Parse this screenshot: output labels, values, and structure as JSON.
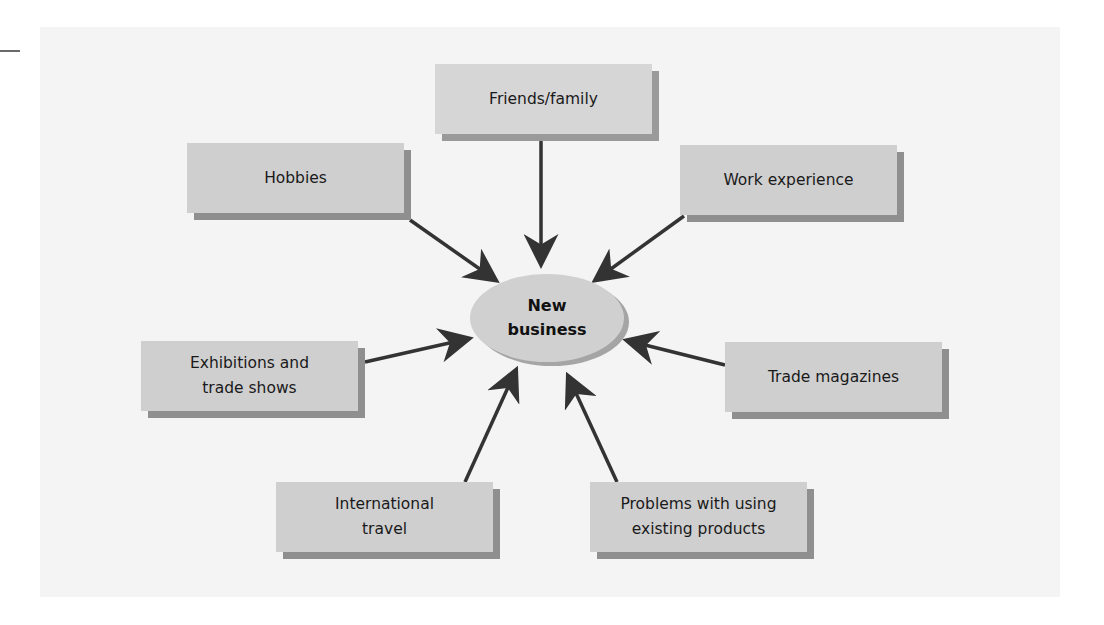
{
  "diagram": {
    "type": "hub-and-spoke",
    "center": {
      "label": "New\nbusiness"
    },
    "sources": [
      {
        "id": "friends-family",
        "label": "Friends/family"
      },
      {
        "id": "hobbies",
        "label": "Hobbies"
      },
      {
        "id": "work-experience",
        "label": "Work experience"
      },
      {
        "id": "exhibitions",
        "label": "Exhibitions and\ntrade shows"
      },
      {
        "id": "trade-magazines",
        "label": "Trade magazines"
      },
      {
        "id": "international-travel",
        "label": "International\ntravel"
      },
      {
        "id": "problems",
        "label": "Problems with using\nexisting products"
      }
    ],
    "edges": [
      {
        "from": "friends-family",
        "to": "center"
      },
      {
        "from": "hobbies",
        "to": "center"
      },
      {
        "from": "work-experience",
        "to": "center"
      },
      {
        "from": "exhibitions",
        "to": "center"
      },
      {
        "from": "trade-magazines",
        "to": "center"
      },
      {
        "from": "international-travel",
        "to": "center"
      },
      {
        "from": "problems",
        "to": "center"
      }
    ],
    "colors": {
      "box_fill": "#cfcfcf",
      "box_shadow": "#8f8f8f",
      "center_fill": "#d0d0d0",
      "arrow": "#333333",
      "panel": "#f4f4f4"
    }
  }
}
